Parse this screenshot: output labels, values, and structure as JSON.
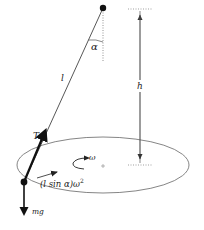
{
  "diagram": {
    "labels": {
      "angle": "α",
      "length": "l",
      "height": "h",
      "tension": "T",
      "angular_velocity": "ω",
      "weight": "mg",
      "centripetal": "(l sin α)ω",
      "centripetal_exp": "2"
    },
    "colors": {
      "line": "#333333",
      "thin_line": "#555555",
      "dotted": "#777777",
      "ellipse": "#666666",
      "text": "#222222",
      "background": "#ffffff"
    }
  }
}
